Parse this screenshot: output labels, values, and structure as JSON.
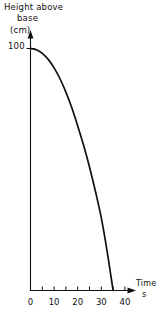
{
  "chart_data": {
    "type": "line",
    "title": "",
    "ylabel": "Height above base (cm)",
    "ylabel_lines": [
      "Height  above",
      "base",
      "(cm)"
    ],
    "xlabel": "Time s",
    "xlabel_lines": [
      "Time",
      "s"
    ],
    "xlim": [
      0,
      42
    ],
    "ylim": [
      0,
      108
    ],
    "grid": false,
    "legend": null,
    "x_ticks_major": [
      0,
      10,
      20,
      30,
      40
    ],
    "x_tick_labels": [
      "0",
      "10",
      "20",
      "30",
      "40"
    ],
    "x_ticks_minor": [
      5,
      15,
      25,
      35
    ],
    "y_ticks_major": [
      100
    ],
    "y_tick_labels": [
      "100"
    ],
    "x": [
      0,
      2.5,
      5,
      7.5,
      10,
      12.5,
      15,
      17.5,
      20,
      22.5,
      25,
      27.5,
      30,
      32.5,
      35
    ],
    "values": [
      100,
      99.5,
      98,
      95.5,
      92,
      87.5,
      82,
      75.5,
      68,
      60,
      51,
      41,
      30,
      16,
      0
    ],
    "series": [
      {
        "name": "height",
        "values": [
          100,
          99.5,
          98,
          95.5,
          92,
          87.5,
          82,
          75.5,
          68,
          60,
          51,
          41,
          30,
          16,
          0
        ]
      }
    ],
    "annotations": []
  },
  "axes": {
    "y_arrow": "up-arrow-icon",
    "x_arrow": "right-arrow-icon"
  }
}
